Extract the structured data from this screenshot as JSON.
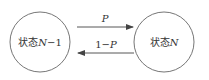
{
  "diagram": {
    "type": "state-transition",
    "nodes": [
      {
        "id": "n_minus_1",
        "label_prefix": "状态",
        "label_var": "N",
        "label_suffix": "−1"
      },
      {
        "id": "n",
        "label_prefix": "状态",
        "label_var": "N",
        "label_suffix": ""
      }
    ],
    "edges": [
      {
        "from": "n_minus_1",
        "to": "n",
        "label": "P"
      },
      {
        "from": "n",
        "to": "n_minus_1",
        "label": "1−P",
        "label_prefix": "1−",
        "label_var": "P"
      }
    ],
    "colors": {
      "stroke": "#555555",
      "text": "#333333",
      "background": "#ffffff"
    }
  }
}
